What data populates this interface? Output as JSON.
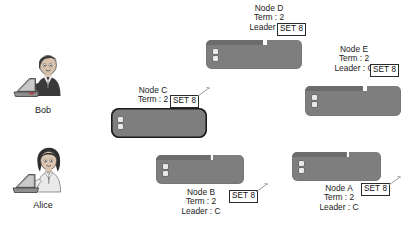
{
  "diagram": {
    "background": "#ffffff",
    "node_color": "#7e7e7e",
    "leader_border_color": "#1b1b1b",
    "text_color": "#1a1a1a"
  },
  "people": [
    {
      "name": "Bob",
      "icon": "person-at-laptop-icon"
    },
    {
      "name": "Alice",
      "icon": "person-at-laptop-icon"
    }
  ],
  "nodes": [
    {
      "id": "A",
      "label": "Node A",
      "term_label": "Term : 2",
      "leader_label": "Leader : C",
      "set_label": "SET 8",
      "is_leader": false,
      "has_flick": true
    },
    {
      "id": "B",
      "label": "Node B",
      "term_label": "Term : 2",
      "leader_label": "Leader : C",
      "set_label": "SET 8",
      "is_leader": false,
      "has_flick": true
    },
    {
      "id": "C",
      "label": "Node C",
      "term_label": "Term : 2",
      "leader_label": "",
      "set_label": "SET 8",
      "is_leader": true,
      "has_flick": true
    },
    {
      "id": "D",
      "label": "Node D",
      "term_label": "Term : 2",
      "leader_label": "Leader : C",
      "set_label": "SET 8",
      "is_leader": false,
      "has_flick": false
    },
    {
      "id": "E",
      "label": "Node E",
      "term_label": "Term : 2",
      "leader_label": "Leader : C",
      "set_label": "SET 8",
      "is_leader": false,
      "has_flick": false
    }
  ]
}
